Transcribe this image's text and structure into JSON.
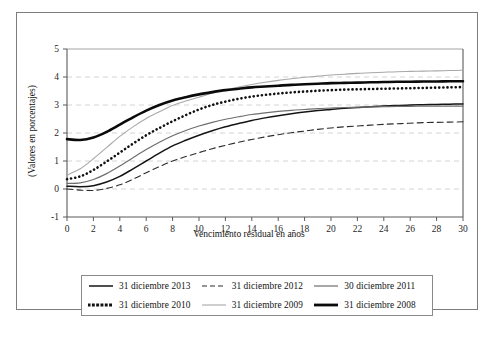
{
  "figure": {
    "background_color": "#ffffff",
    "frame_border_color": "#7d7d7d"
  },
  "chart_data": {
    "type": "line",
    "title": "",
    "subtitle": "",
    "xlabel": "Vencimiento residual en años",
    "ylabel": "(Valores en porcentajes)",
    "xlim": [
      0,
      30
    ],
    "ylim": [
      -1,
      5
    ],
    "xticks": [
      0,
      2,
      4,
      6,
      8,
      10,
      12,
      14,
      16,
      18,
      20,
      22,
      24,
      26,
      28,
      30
    ],
    "yticks": [
      -1,
      0,
      1,
      2,
      3,
      4,
      5
    ],
    "xticklabels": [
      "0",
      "2",
      "4",
      "6",
      "8",
      "10",
      "12",
      "14",
      "16",
      "18",
      "20",
      "22",
      "24",
      "26",
      "28",
      "30"
    ],
    "yticklabels": [
      "-1",
      "0",
      "1",
      "2",
      "3",
      "4",
      "5"
    ],
    "grid": "horizontal-dashed",
    "legend_position": "below-axes",
    "x": [
      0,
      1,
      2,
      3,
      4,
      5,
      6,
      7,
      8,
      9,
      10,
      11,
      12,
      13,
      14,
      15,
      16,
      17,
      18,
      19,
      20,
      21,
      22,
      23,
      24,
      25,
      26,
      27,
      28,
      29,
      30
    ],
    "series": [
      {
        "name": "31 diciembre 2013",
        "style": "solid",
        "color": "#141414",
        "width": 1.5,
        "values": [
          0.1,
          0.08,
          0.12,
          0.25,
          0.45,
          0.72,
          1.0,
          1.28,
          1.54,
          1.74,
          1.92,
          2.08,
          2.22,
          2.34,
          2.45,
          2.54,
          2.62,
          2.69,
          2.75,
          2.8,
          2.84,
          2.88,
          2.91,
          2.94,
          2.96,
          2.98,
          3.0,
          3.01,
          3.02,
          3.03,
          3.04
        ]
      },
      {
        "name": "31 diciembre 2012",
        "style": "dashed",
        "color": "#2b2b2b",
        "width": 1.1,
        "values": [
          0.0,
          -0.04,
          -0.05,
          0.02,
          0.15,
          0.35,
          0.58,
          0.8,
          1.0,
          1.16,
          1.3,
          1.44,
          1.56,
          1.67,
          1.77,
          1.86,
          1.94,
          2.01,
          2.07,
          2.13,
          2.18,
          2.22,
          2.25,
          2.28,
          2.31,
          2.33,
          2.35,
          2.37,
          2.38,
          2.39,
          2.4
        ]
      },
      {
        "name": "30 diciembre 2011",
        "style": "solid",
        "color": "#6e6e6e",
        "width": 1.2,
        "values": [
          0.2,
          0.22,
          0.34,
          0.55,
          0.82,
          1.12,
          1.41,
          1.67,
          1.9,
          2.09,
          2.25,
          2.38,
          2.49,
          2.58,
          2.66,
          2.72,
          2.77,
          2.81,
          2.84,
          2.87,
          2.89,
          2.91,
          2.92,
          2.93,
          2.94,
          2.95,
          2.95,
          2.96,
          2.96,
          2.96,
          2.96
        ]
      },
      {
        "name": "31 diciembre 2010",
        "style": "dotted",
        "color": "#111111",
        "width": 2.6,
        "values": [
          0.35,
          0.45,
          0.68,
          0.98,
          1.3,
          1.62,
          1.92,
          2.18,
          2.42,
          2.64,
          2.84,
          3.0,
          3.12,
          3.22,
          3.3,
          3.36,
          3.41,
          3.45,
          3.48,
          3.51,
          3.53,
          3.55,
          3.56,
          3.57,
          3.58,
          3.59,
          3.6,
          3.61,
          3.62,
          3.63,
          3.64
        ]
      },
      {
        "name": "31 diciembre 2009",
        "style": "solid",
        "color": "#a8a8a8",
        "width": 1.1,
        "values": [
          0.5,
          0.72,
          1.08,
          1.48,
          1.88,
          2.22,
          2.52,
          2.76,
          2.98,
          3.14,
          3.28,
          3.42,
          3.54,
          3.64,
          3.73,
          3.81,
          3.88,
          3.94,
          3.99,
          4.03,
          4.07,
          4.1,
          4.13,
          4.15,
          4.17,
          4.19,
          4.2,
          4.21,
          4.22,
          4.23,
          4.24
        ]
      },
      {
        "name": "31 diciembre 2008",
        "style": "solid",
        "color": "#0a0a0a",
        "width": 2.6,
        "values": [
          1.78,
          1.75,
          1.84,
          2.04,
          2.3,
          2.56,
          2.8,
          3.0,
          3.16,
          3.28,
          3.38,
          3.46,
          3.53,
          3.58,
          3.63,
          3.66,
          3.69,
          3.72,
          3.74,
          3.76,
          3.78,
          3.79,
          3.8,
          3.81,
          3.82,
          3.83,
          3.83,
          3.84,
          3.84,
          3.85,
          3.85
        ]
      }
    ]
  },
  "legend": {
    "rows": [
      [
        {
          "label": "31 diciembre 2013",
          "swatch": "solid-black-thin"
        },
        {
          "label": "31 diciembre 2012",
          "swatch": "dashed-black"
        },
        {
          "label": "30 diciembre 2011",
          "swatch": "solid-gray-thin"
        }
      ],
      [
        {
          "label": "31 diciembre 2010",
          "swatch": "dotted-black-thick"
        },
        {
          "label": "31 diciembre 2009",
          "swatch": "solid-lightgray-thin"
        },
        {
          "label": "31 diciembre 2008",
          "swatch": "solid-black-thick"
        }
      ]
    ]
  },
  "caption": {
    "text": ""
  }
}
